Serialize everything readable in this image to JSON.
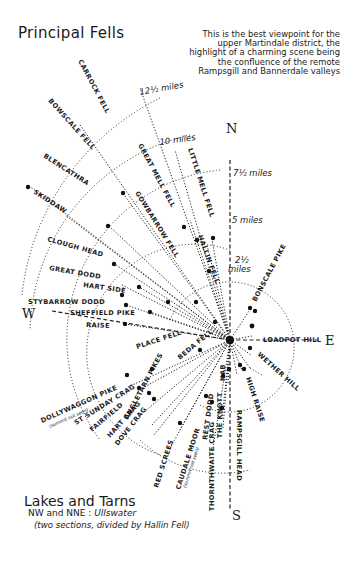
{
  "title": "Principal Fells",
  "note": "This is the best viewpoint for the upper Martindale district, the highlight of a charming scene being the confluence of the remote Rampsgill and Bannerdale valleys",
  "compass": {
    "north": "N",
    "south": "S",
    "east": "E",
    "west": "W"
  },
  "distance_rings": [
    {
      "label": "2½ miles",
      "label_top": "2½",
      "label_bottom": "miles"
    },
    {
      "label": "5 miles"
    },
    {
      "label": "7½ miles"
    },
    {
      "label": "10 miles"
    },
    {
      "label": "12½ miles"
    }
  ],
  "fells": [
    {
      "name": "CARROCK FELL"
    },
    {
      "name": "BOWSCALE FELL"
    },
    {
      "name": "BLENCATHRA"
    },
    {
      "name": "SKIDDAW"
    },
    {
      "name": "GREAT MELL FELL"
    },
    {
      "name": "GOWBARROW FELL"
    },
    {
      "name": "LITTLE MELL FELL"
    },
    {
      "name": "HALLIN FELL"
    },
    {
      "name": "CLOUGH HEAD"
    },
    {
      "name": "GREAT DODD"
    },
    {
      "name": "HART SIDE"
    },
    {
      "name": "STYBARROW DODD"
    },
    {
      "name": "SHEFFIELD PIKE"
    },
    {
      "name": "RAISE"
    },
    {
      "name": "PLACE FELL"
    },
    {
      "name": "BEDA FELL"
    },
    {
      "name": "DOLLYWAGGON PIKE",
      "note": "(summit not seen)"
    },
    {
      "name": "ST SUNDAY CRAG"
    },
    {
      "name": "FAIRFIELD"
    },
    {
      "name": "HART CRAG"
    },
    {
      "name": "DOVE CRAG"
    },
    {
      "name": "ANGLETARN PIKES"
    },
    {
      "name": "RED SCREES"
    },
    {
      "name": "CAUDALE MOOR",
      "note": "(summit not seen)"
    },
    {
      "name": "THORNTHWAITE CRAG"
    },
    {
      "name": "REST DODD"
    },
    {
      "name": "THE KNOTT"
    },
    {
      "name": "NAB"
    },
    {
      "name": "RAMPSGILL HEAD"
    },
    {
      "name": "HIGH RAISE"
    },
    {
      "name": "BONSCALE PIKE"
    },
    {
      "name": "LOADPOT HILL"
    },
    {
      "name": "WETHER HILL"
    }
  ],
  "lakes": {
    "heading": "Lakes and Tarns",
    "line_prefix": "NW and NNE : ",
    "line_lake": "Ullswater",
    "note": "(two sections, divided by Hallin Fell)"
  }
}
